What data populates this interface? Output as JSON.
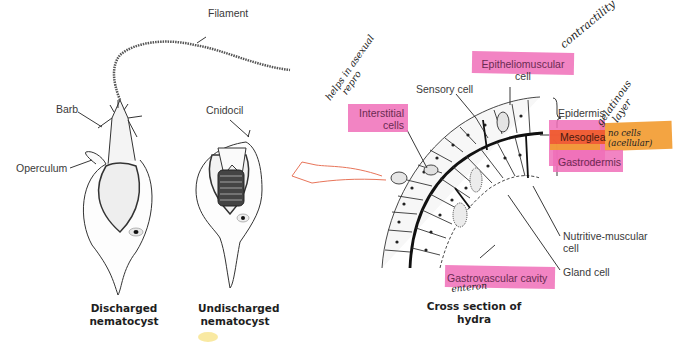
{
  "figure": {
    "left_panel": {
      "labels": {
        "filament": "Filament",
        "barb": "Barb",
        "operculum": "Operculum",
        "cnidocil": "Cnidocil"
      },
      "captions": {
        "discharged": [
          "Discharged",
          "nematocyst"
        ],
        "undischarged": [
          "Undischarged",
          "nematocyst"
        ]
      }
    },
    "right_panel": {
      "labels": {
        "epitheliomuscular": [
          "Epitheliomuscular",
          "cell"
        ],
        "sensory_cell": "Sensory cell",
        "interstitial": [
          "Interstitial",
          "cells"
        ],
        "epidermis": "Epidermis",
        "mesoglea": "Mesoglea",
        "gastrodermis": "Gastrodermis",
        "nutritive_muscular": [
          "Nutritive-muscular",
          "cell"
        ],
        "gland_cell": "Gland cell",
        "gastrovascular_cavity": "Gastrovascular cavity"
      },
      "caption": "Cross section of hydra"
    },
    "handwritten_notes": {
      "contractility": "contractility",
      "helps_asexual": [
        "helps in asexual",
        "repro"
      ],
      "gelatinous_layer": [
        "gelatinous",
        "layer"
      ],
      "no_cells": [
        "no cells",
        "(acellular)"
      ],
      "enteron": "enteron"
    },
    "highlight_colors": {
      "pink": "#f06fb8",
      "orange": "#f29a2e",
      "red_orange": "#ef5a28",
      "arrow": "#e8755a"
    }
  }
}
